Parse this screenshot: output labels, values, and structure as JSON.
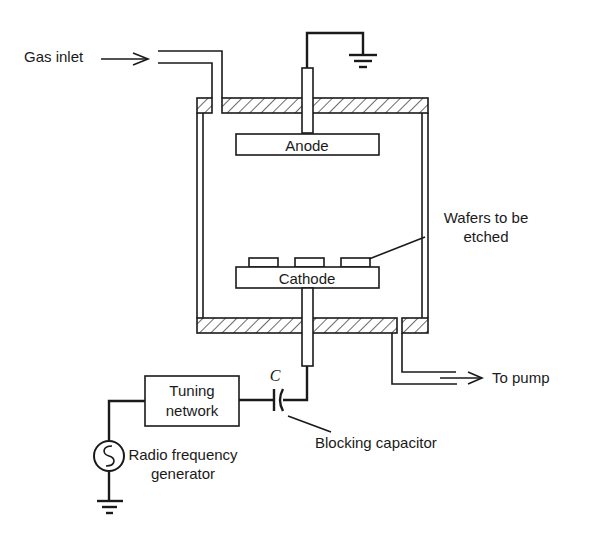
{
  "diagram": {
    "type": "RF plasma etching reactor schematic",
    "labels": {
      "gas_inlet": "Gas inlet",
      "anode": "Anode",
      "cathode": "Cathode",
      "wafers": [
        "Wafers to be",
        "etched"
      ],
      "to_pump": "To pump",
      "capacitor_symbol": "C",
      "tuning_network": [
        "Tuning",
        "network"
      ],
      "rf_generator": [
        "Radio frequency",
        "generator"
      ],
      "blocking_capacitor": "Blocking capacitor"
    },
    "components": [
      {
        "id": "chamber",
        "name": "Vacuum chamber"
      },
      {
        "id": "anode",
        "name": "Anode",
        "grounded": true
      },
      {
        "id": "cathode",
        "name": "Cathode",
        "wafers": 3
      },
      {
        "id": "capacitor",
        "name": "Blocking capacitor"
      },
      {
        "id": "tuning",
        "name": "Tuning network"
      },
      {
        "id": "rf",
        "name": "Radio frequency generator",
        "grounded": true
      }
    ],
    "colors": {
      "ink": "#1a1a1a",
      "background": "#ffffff"
    }
  }
}
